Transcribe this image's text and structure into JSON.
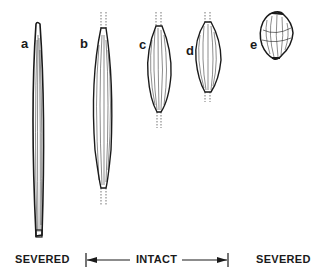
{
  "figure": {
    "panels": [
      {
        "id": "a",
        "label": "a",
        "state": "severed"
      },
      {
        "id": "b",
        "label": "b",
        "state": "intact"
      },
      {
        "id": "c",
        "label": "c",
        "state": "intact"
      },
      {
        "id": "d",
        "label": "d",
        "state": "intact"
      },
      {
        "id": "e",
        "label": "e",
        "state": "severed"
      }
    ],
    "captions": {
      "left": "SEVERED",
      "middle": "INTACT",
      "right": "SEVERED"
    },
    "colors": {
      "ink": "#1a1a1a",
      "background": "#ffffff"
    }
  }
}
